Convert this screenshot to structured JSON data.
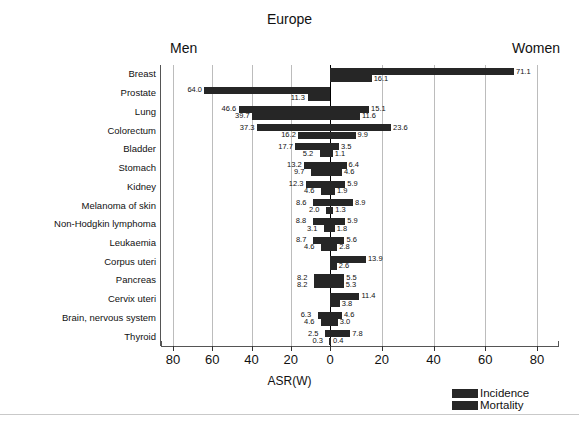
{
  "title": "Europe",
  "side_labels": {
    "left": "Men",
    "right": "Women"
  },
  "axis": {
    "xlabel": "ASR(W)",
    "ticks": [
      "80",
      "60",
      "40",
      "20",
      "0",
      "20",
      "40",
      "60",
      "80"
    ]
  },
  "legend": {
    "position": "bottom-right",
    "items": [
      {
        "label": "Incidence",
        "color": "#262626"
      },
      {
        "label": "Mortality",
        "color": "#262626"
      }
    ]
  },
  "chart_data": {
    "type": "bar",
    "orientation": "horizontal-diverging",
    "title": "Europe",
    "xlabel": "ASR(W)",
    "ylabel": "",
    "xlim": [
      -80,
      80
    ],
    "grid": true,
    "legend": [
      "Incidence",
      "Mortality"
    ],
    "left_group": "Men",
    "right_group": "Women",
    "categories": [
      "Breast",
      "Prostate",
      "Lung",
      "Colorectum",
      "Bladder",
      "Stomach",
      "Kidney",
      "Melanoma of skin",
      "Non-Hodgkin lymphoma",
      "Leukaemia",
      "Corpus uteri",
      "Pancreas",
      "Cervix uteri",
      "Brain, nervous system",
      "Thyroid"
    ],
    "series": [
      {
        "name": "Men Incidence",
        "group": "Men",
        "measure": "Incidence",
        "values": [
          0.0,
          64.0,
          46.6,
          37.3,
          17.7,
          13.2,
          12.3,
          8.6,
          8.8,
          8.7,
          0.0,
          8.2,
          0.0,
          6.3,
          2.5
        ]
      },
      {
        "name": "Men Mortality",
        "group": "Men",
        "measure": "Mortality",
        "values": [
          0.0,
          11.3,
          39.7,
          16.2,
          5.2,
          9.7,
          4.6,
          2.0,
          3.1,
          4.6,
          0.0,
          8.2,
          0.0,
          4.6,
          0.3
        ]
      },
      {
        "name": "Women Incidence",
        "group": "Women",
        "measure": "Incidence",
        "values": [
          71.1,
          0.0,
          15.1,
          23.6,
          3.5,
          6.4,
          5.9,
          8.9,
          5.9,
          5.6,
          13.9,
          5.5,
          11.4,
          4.6,
          7.8
        ]
      },
      {
        "name": "Women Mortality",
        "group": "Women",
        "measure": "Mortality",
        "values": [
          16.1,
          0.0,
          11.6,
          9.9,
          1.1,
          4.6,
          1.9,
          1.3,
          1.8,
          2.8,
          2.6,
          5.3,
          3.8,
          3.0,
          0.4
        ]
      }
    ]
  }
}
